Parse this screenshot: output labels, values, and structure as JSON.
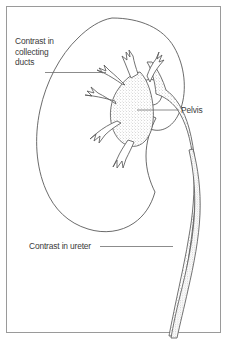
{
  "figure": {
    "background_color": "#ffffff",
    "frame_color": "#9a9a9a",
    "outline_color": "#555555",
    "stipple_color": "#8d8d8d",
    "text_color": "#3b3b3b",
    "leader_color": "#6e6e6e"
  },
  "labels": {
    "collecting_ducts": {
      "line1": "Contrast in",
      "line2": "collecting",
      "line3": "ducts"
    },
    "pelvis": "Pelvis",
    "ureter": "Contrast in ureter"
  },
  "anatomy": {
    "kidney_outline": "kidney-cortex-outline",
    "pelvis_region": "renal-pelvis",
    "calyces": "collecting-ducts-calyces",
    "ureter": "ureter-tube"
  }
}
